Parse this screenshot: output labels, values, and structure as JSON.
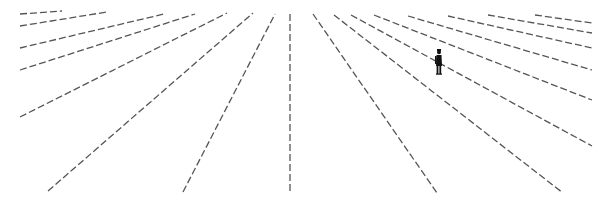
{
  "scene": {
    "description": "Dashed perspective lines radiating toward a vanishing point with a small standing figure",
    "line_color": "#555555",
    "figure_color": "#111111",
    "dash": "7 3",
    "lines": [
      {
        "x1": 20,
        "y1": 14,
        "x2": 62,
        "y2": 11
      },
      {
        "x1": 20,
        "y1": 26,
        "x2": 107,
        "y2": 12
      },
      {
        "x1": 20,
        "y1": 48,
        "x2": 164,
        "y2": 14
      },
      {
        "x1": 20,
        "y1": 70,
        "x2": 195,
        "y2": 14
      },
      {
        "x1": 20,
        "y1": 117,
        "x2": 227,
        "y2": 13
      },
      {
        "x1": 48,
        "y1": 191,
        "x2": 253,
        "y2": 13
      },
      {
        "x1": 183,
        "y1": 192,
        "x2": 275,
        "y2": 14
      },
      {
        "x1": 290,
        "y1": 14,
        "x2": 290,
        "y2": 193
      },
      {
        "x1": 313,
        "y1": 14,
        "x2": 437,
        "y2": 193
      },
      {
        "x1": 334,
        "y1": 15,
        "x2": 563,
        "y2": 193
      },
      {
        "x1": 351,
        "y1": 15,
        "x2": 592,
        "y2": 146
      },
      {
        "x1": 374,
        "y1": 15,
        "x2": 592,
        "y2": 100
      },
      {
        "x1": 408,
        "y1": 16,
        "x2": 592,
        "y2": 70
      },
      {
        "x1": 448,
        "y1": 16,
        "x2": 592,
        "y2": 48
      },
      {
        "x1": 488,
        "y1": 15,
        "x2": 592,
        "y2": 33
      },
      {
        "x1": 535,
        "y1": 15,
        "x2": 592,
        "y2": 23
      }
    ],
    "figure": {
      "x": 438,
      "y": 49,
      "height": 25
    }
  }
}
